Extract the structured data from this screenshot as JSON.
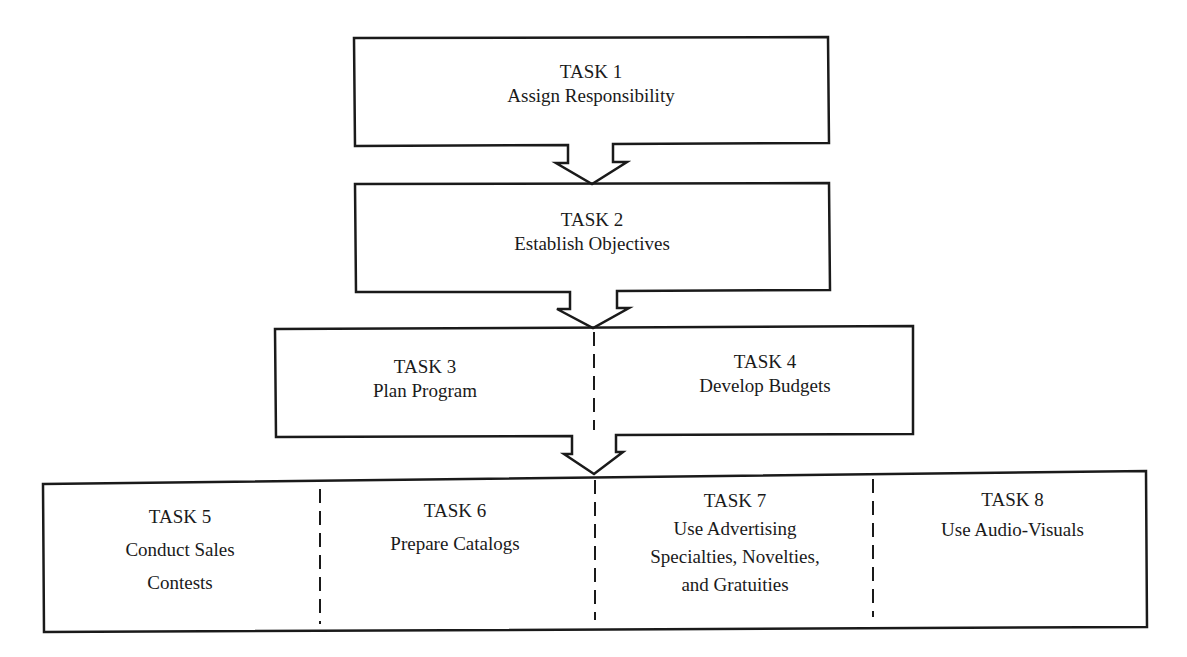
{
  "diagram": {
    "type": "flowchart",
    "stages": [
      {
        "id": "stage1",
        "tasks": [
          {
            "title": "TASK 1",
            "description": "Assign Responsibility"
          }
        ]
      },
      {
        "id": "stage2",
        "tasks": [
          {
            "title": "TASK 2",
            "description": "Establish Objectives"
          }
        ]
      },
      {
        "id": "stage3",
        "tasks": [
          {
            "title": "TASK 3",
            "description": "Plan Program"
          },
          {
            "title": "TASK 4",
            "description": "Develop Budgets"
          }
        ]
      },
      {
        "id": "stage4",
        "tasks": [
          {
            "title": "TASK 5",
            "description": "Conduct Sales Contests"
          },
          {
            "title": "TASK 6",
            "description": "Prepare Catalogs"
          },
          {
            "title": "TASK 7",
            "description": "Use Advertising Specialties, Novelties, and Gratuities"
          },
          {
            "title": "TASK 8",
            "description": "Use Audio-Visuals"
          }
        ]
      }
    ],
    "flow": [
      "stage1 -> stage2",
      "stage2 -> stage3",
      "stage3 -> stage4"
    ],
    "line_color": "#1a1a1a"
  },
  "text": {
    "t1_title": "TASK 1",
    "t1_desc": "Assign Responsibility",
    "t2_title": "TASK 2",
    "t2_desc": "Establish Objectives",
    "t3_title": "TASK 3",
    "t3_desc": "Plan Program",
    "t4_title": "TASK 4",
    "t4_desc": "Develop Budgets",
    "t5_title": "TASK 5",
    "t5_desc_1": "Conduct Sales",
    "t5_desc_2": "Contests",
    "t6_title": "TASK 6",
    "t6_desc": "Prepare Catalogs",
    "t7_title": "TASK 7",
    "t7_desc_1": "Use Advertising",
    "t7_desc_2": "Specialties, Novelties,",
    "t7_desc_3": "and Gratuities",
    "t8_title": "TASK 8",
    "t8_desc": "Use Audio-Visuals"
  }
}
